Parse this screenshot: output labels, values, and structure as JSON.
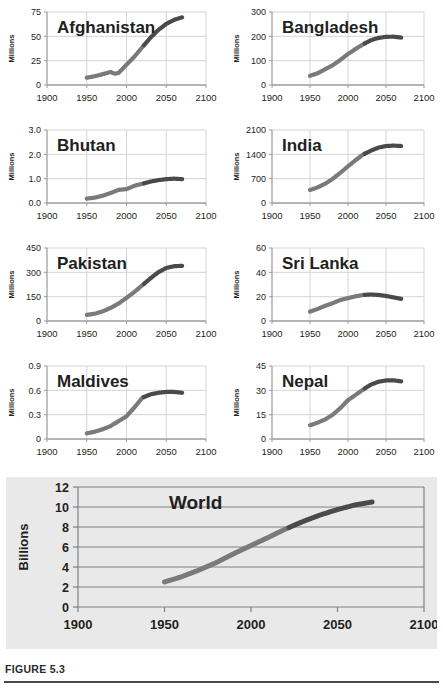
{
  "figure": {
    "caption": "FIGURE 5.3",
    "colors": {
      "line_history": "#7a7a7a",
      "line_projection": "#4a4a4a",
      "grid": "#d4d4d4",
      "axis": "#9a9a9a",
      "world_panel_bg": "#e9e9e9",
      "world_grid": "#808080",
      "text": "#231f20"
    }
  },
  "chart_data": [
    {
      "type": "line",
      "title": "Afghanistan",
      "ylabel": "Millions",
      "xlabel": "",
      "xlim": [
        1900,
        2100
      ],
      "ylim": [
        0,
        75
      ],
      "xticks": [
        "1900",
        "1950",
        "2000",
        "2050",
        "2100"
      ],
      "yticks": [
        "0",
        "25",
        "50",
        "75"
      ],
      "grid": true,
      "split_year": 2022,
      "x": [
        1950,
        1960,
        1970,
        1980,
        1985,
        1990,
        2000,
        2010,
        2020,
        2030,
        2040,
        2050,
        2060,
        2070
      ],
      "values": [
        7.5,
        9.0,
        11.1,
        13.4,
        11.6,
        12.4,
        20.8,
        29.2,
        39.0,
        48.5,
        56.5,
        62.8,
        67.0,
        69.5
      ]
    },
    {
      "type": "line",
      "title": "Bangladesh",
      "ylabel": "Millions",
      "xlabel": "",
      "xlim": [
        1900,
        2100
      ],
      "ylim": [
        0,
        300
      ],
      "xticks": [
        "1900",
        "1950",
        "2000",
        "2050",
        "2100"
      ],
      "yticks": [
        "0",
        "100",
        "200",
        "300"
      ],
      "grid": true,
      "split_year": 2022,
      "x": [
        1950,
        1960,
        1970,
        1980,
        1990,
        2000,
        2010,
        2020,
        2030,
        2040,
        2050,
        2060,
        2070
      ],
      "values": [
        37.9,
        48.2,
        65.0,
        81.5,
        103.2,
        127.7,
        148.4,
        167.4,
        184.0,
        193.5,
        198.0,
        198.5,
        195.0
      ]
    },
    {
      "type": "line",
      "title": "Bhutan",
      "ylabel": "Millions",
      "xlabel": "",
      "xlim": [
        1900,
        2100
      ],
      "ylim": [
        0,
        3.0
      ],
      "xticks": [
        "1900",
        "1950",
        "2000",
        "2050",
        "2100"
      ],
      "yticks": [
        "0.0",
        "1.0",
        "2.0",
        "3.0"
      ],
      "grid": true,
      "split_year": 2022,
      "x": [
        1950,
        1960,
        1970,
        1980,
        1990,
        2000,
        2005,
        2010,
        2020,
        2030,
        2040,
        2050,
        2060,
        2070
      ],
      "values": [
        0.18,
        0.22,
        0.3,
        0.41,
        0.54,
        0.57,
        0.64,
        0.71,
        0.79,
        0.88,
        0.94,
        0.98,
        1.0,
        0.98
      ]
    },
    {
      "type": "line",
      "title": "India",
      "ylabel": "Millions",
      "xlabel": "",
      "xlim": [
        1900,
        2100
      ],
      "ylim": [
        0,
        2100
      ],
      "xticks": [
        "1900",
        "1950",
        "2000",
        "2050",
        "2100"
      ],
      "yticks": [
        "0",
        "700",
        "1400",
        "2100"
      ],
      "grid": true,
      "split_year": 2022,
      "x": [
        1950,
        1960,
        1970,
        1980,
        1990,
        2000,
        2010,
        2020,
        2030,
        2040,
        2050,
        2060,
        2070
      ],
      "values": [
        376,
        450,
        555,
        698,
        870,
        1057,
        1234,
        1396,
        1504,
        1593,
        1639,
        1650,
        1640
      ]
    },
    {
      "type": "line",
      "title": "Pakistan",
      "ylabel": "Millions",
      "xlabel": "",
      "xlim": [
        1900,
        2100
      ],
      "ylim": [
        0,
        450
      ],
      "xticks": [
        "1900",
        "1950",
        "2000",
        "2050",
        "2100"
      ],
      "yticks": [
        "0",
        "150",
        "300",
        "450"
      ],
      "grid": true,
      "split_year": 2022,
      "x": [
        1950,
        1960,
        1970,
        1980,
        1990,
        2000,
        2010,
        2020,
        2030,
        2040,
        2050,
        2060,
        2070
      ],
      "values": [
        37.5,
        45.0,
        59.3,
        80.6,
        107.7,
        142.3,
        179.4,
        220.9,
        262.9,
        300.5,
        327.0,
        338.0,
        340.0
      ]
    },
    {
      "type": "line",
      "title": "Sri Lanka",
      "ylabel": "Millions",
      "xlabel": "",
      "xlim": [
        1900,
        2100
      ],
      "ylim": [
        0,
        60
      ],
      "xticks": [
        "1900",
        "1950",
        "2000",
        "2050",
        "2100"
      ],
      "yticks": [
        "0",
        "20",
        "40",
        "60"
      ],
      "grid": true,
      "split_year": 2022,
      "x": [
        1950,
        1960,
        1970,
        1980,
        1990,
        2000,
        2010,
        2020,
        2030,
        2040,
        2050,
        2060,
        2070
      ],
      "values": [
        7.7,
        9.9,
        12.5,
        14.7,
        17.3,
        18.8,
        20.3,
        21.4,
        21.8,
        21.4,
        20.6,
        19.4,
        18.2
      ]
    },
    {
      "type": "line",
      "title": "Maldives",
      "ylabel": "Millions",
      "xlabel": "",
      "xlim": [
        1900,
        2100
      ],
      "ylim": [
        0,
        0.9
      ],
      "xticks": [
        "1900",
        "1950",
        "2000",
        "2050",
        "2100"
      ],
      "yticks": [
        "0",
        "0.3",
        "0.6",
        "0.9"
      ],
      "grid": true,
      "split_year": 2022,
      "x": [
        1950,
        1960,
        1970,
        1980,
        1990,
        2000,
        2010,
        2020,
        2030,
        2040,
        2050,
        2060,
        2070
      ],
      "values": [
        0.07,
        0.09,
        0.12,
        0.16,
        0.22,
        0.28,
        0.39,
        0.51,
        0.55,
        0.57,
        0.58,
        0.58,
        0.57
      ]
    },
    {
      "type": "line",
      "title": "Nepal",
      "ylabel": "Millions",
      "xlabel": "",
      "xlim": [
        1900,
        2100
      ],
      "ylim": [
        0,
        45
      ],
      "xticks": [
        "1900",
        "1950",
        "2000",
        "2050",
        "2100"
      ],
      "yticks": [
        "0",
        "15",
        "30",
        "45"
      ],
      "grid": true,
      "split_year": 2022,
      "x": [
        1950,
        1960,
        1970,
        1980,
        1990,
        2000,
        2010,
        2020,
        2030,
        2040,
        2050,
        2060,
        2070
      ],
      "values": [
        8.5,
        10.1,
        12.1,
        15.0,
        19.1,
        23.9,
        27.2,
        30.5,
        33.5,
        35.3,
        36.1,
        36.2,
        35.5
      ]
    },
    {
      "type": "line",
      "title": "World",
      "ylabel": "Billions",
      "xlabel": "",
      "xlim": [
        1900,
        2100
      ],
      "ylim": [
        0,
        12
      ],
      "xticks": [
        "1900",
        "1950",
        "2000",
        "2050",
        "2100"
      ],
      "yticks": [
        "0",
        "2",
        "4",
        "6",
        "8",
        "10",
        "12"
      ],
      "grid": true,
      "split_year": 2022,
      "x": [
        1950,
        1960,
        1970,
        1980,
        1990,
        2000,
        2010,
        2020,
        2030,
        2040,
        2050,
        2060,
        2070
      ],
      "values": [
        2.5,
        3.03,
        3.7,
        4.45,
        5.33,
        6.15,
        6.96,
        7.8,
        8.55,
        9.2,
        9.75,
        10.2,
        10.5
      ]
    }
  ]
}
